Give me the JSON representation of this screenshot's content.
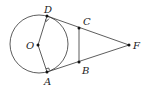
{
  "diagram": {
    "type": "geometry",
    "circle": {
      "center_label": "O",
      "cx": 39,
      "cy": 44,
      "r": 29
    },
    "points": {
      "D": {
        "label": "D",
        "x": 47,
        "y": 16
      },
      "A": {
        "label": "A",
        "x": 47,
        "y": 72
      },
      "O": {
        "label": "O",
        "x": 38,
        "y": 45
      },
      "C": {
        "label": "C",
        "x": 79,
        "y": 28
      },
      "B": {
        "label": "B",
        "x": 79,
        "y": 62
      },
      "F": {
        "label": "F",
        "x": 129,
        "y": 45
      }
    },
    "segments": [
      "OD",
      "OA",
      "DF",
      "AF",
      "CB"
    ],
    "right_angles": [
      "ODF",
      "OAF"
    ],
    "colors": {
      "stroke": "#333333",
      "point": "#111111",
      "background": "#ffffff"
    }
  }
}
